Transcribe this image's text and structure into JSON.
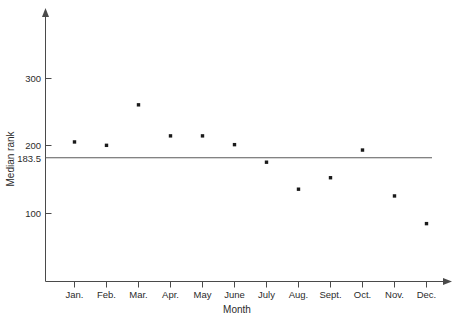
{
  "chart_data": {
    "type": "scatter",
    "title": "",
    "xlabel": "Month",
    "ylabel": "Median rank",
    "categories": [
      "Jan.",
      "Feb.",
      "Mar.",
      "Apr.",
      "May",
      "June",
      "July",
      "Aug.",
      "Sept.",
      "Oct.",
      "Nov.",
      "Dec."
    ],
    "values": [
      206,
      201,
      261,
      215,
      215,
      202,
      176,
      136,
      153,
      194,
      126,
      85
    ],
    "ylim": [
      30,
      380
    ],
    "yticks": [
      100,
      183.5,
      200,
      300
    ],
    "ytick_labels": [
      "100",
      "183.5",
      "200",
      "300"
    ],
    "grid": false,
    "legend": null,
    "annotations": [
      {
        "name": "reference-line",
        "kind": "horizontal-line",
        "value": 183.5,
        "label": "183.5"
      }
    ],
    "series": [
      {
        "name": "Median rank",
        "marker": "square",
        "color": "#1a1a1a",
        "points": [
          {
            "x": "Jan.",
            "y": 206
          },
          {
            "x": "Feb.",
            "y": 201
          },
          {
            "x": "Mar.",
            "y": 261
          },
          {
            "x": "Apr.",
            "y": 215
          },
          {
            "x": "May",
            "y": 215
          },
          {
            "x": "June",
            "y": 202
          },
          {
            "x": "July",
            "y": 176
          },
          {
            "x": "Aug.",
            "y": 136
          },
          {
            "x": "Sept.",
            "y": 153
          },
          {
            "x": "Oct.",
            "y": 194
          },
          {
            "x": "Nov.",
            "y": 126
          },
          {
            "x": "Dec.",
            "y": 85
          }
        ]
      }
    ]
  },
  "axes": {
    "y_title": "Median rank",
    "x_title": "Month",
    "y_tick_labels": [
      "300",
      "200",
      "183.5",
      "100"
    ],
    "x_tick_labels": [
      "Jan.",
      "Feb.",
      "Mar.",
      "Apr.",
      "May",
      "June",
      "July",
      "Aug.",
      "Sept.",
      "Oct.",
      "Nov.",
      "Dec."
    ]
  },
  "colors": {
    "axis": "#4a4a4a",
    "marker": "#1a1a1a",
    "reference_line": "#5a5a5a",
    "text": "#2b2b2b",
    "background": "#ffffff"
  }
}
